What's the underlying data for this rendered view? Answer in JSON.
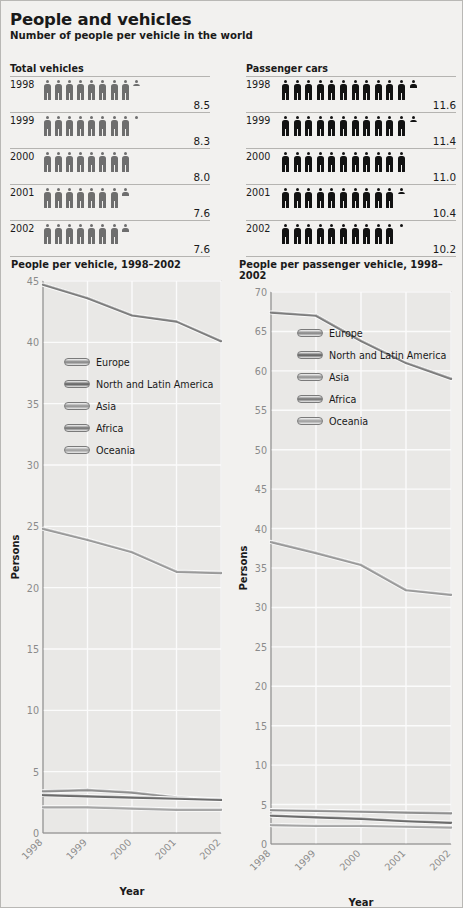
{
  "header": {
    "title": "People and vehicles",
    "subtitle": "Number of people per vehicle in the world"
  },
  "pictograms": [
    {
      "heading": "Total vehicles",
      "icon_color": "#6e6e6e",
      "rows": [
        {
          "year": "1998",
          "value": "8.5",
          "whole": 8,
          "fraction": 0.5
        },
        {
          "year": "1999",
          "value": "8.3",
          "whole": 8,
          "fraction": 0.3
        },
        {
          "year": "2000",
          "value": "8.0",
          "whole": 8,
          "fraction": 0.0
        },
        {
          "year": "2001",
          "value": "7.6",
          "whole": 7,
          "fraction": 0.6
        },
        {
          "year": "2002",
          "value": "7.6",
          "whole": 7,
          "fraction": 0.6
        }
      ]
    },
    {
      "heading": "Passenger cars",
      "icon_color": "#121212",
      "rows": [
        {
          "year": "1998",
          "value": "11.6",
          "whole": 11,
          "fraction": 0.6
        },
        {
          "year": "1999",
          "value": "11.4",
          "whole": 11,
          "fraction": 0.4
        },
        {
          "year": "2000",
          "value": "11.0",
          "whole": 11,
          "fraction": 0.0
        },
        {
          "year": "2001",
          "value": "10.4",
          "whole": 10,
          "fraction": 0.4
        },
        {
          "year": "2002",
          "value": "10.2",
          "whole": 10,
          "fraction": 0.2
        }
      ]
    }
  ],
  "legend_labels": [
    "Europe",
    "North and Latin America",
    "Asia",
    "Africa",
    "Oceania"
  ],
  "series_colors": [
    "#8f8f8f",
    "#6b6b6b",
    "#9a9a9a",
    "#7d7d7d",
    "#a5a5a5"
  ],
  "chart_data": [
    {
      "type": "line",
      "title": "People per vehicle, 1998–2002",
      "xlabel": "Year",
      "ylabel": "Persons",
      "x": [
        "1998",
        "1999",
        "2000",
        "2001",
        "2002"
      ],
      "ylim": [
        0,
        45
      ],
      "yticks": [
        0,
        5,
        10,
        15,
        20,
        25,
        30,
        35,
        40,
        45
      ],
      "grid": true,
      "legend_position": "inside-upper-left",
      "series": [
        {
          "name": "Europe",
          "values": [
            3.4,
            3.5,
            3.3,
            2.9,
            2.7
          ]
        },
        {
          "name": "North and Latin America",
          "values": [
            3.1,
            3.0,
            2.9,
            2.8,
            2.7
          ]
        },
        {
          "name": "Asia",
          "values": [
            24.8,
            23.9,
            22.9,
            21.3,
            21.2
          ]
        },
        {
          "name": "Africa",
          "values": [
            44.7,
            43.6,
            42.2,
            41.7,
            40.1
          ]
        },
        {
          "name": "Oceania",
          "values": [
            2.1,
            2.1,
            2.0,
            1.9,
            1.9
          ]
        }
      ]
    },
    {
      "type": "line",
      "title": "People per passenger vehicle, 1998–2002",
      "xlabel": "Year",
      "ylabel": "Persons",
      "x": [
        "1998",
        "1999",
        "2000",
        "2001",
        "2002"
      ],
      "ylim": [
        0,
        70
      ],
      "yticks": [
        0,
        5,
        10,
        15,
        20,
        25,
        30,
        35,
        40,
        45,
        50,
        55,
        60,
        65,
        70
      ],
      "grid": true,
      "legend_position": "inside-upper-left",
      "series": [
        {
          "name": "Europe",
          "values": [
            4.3,
            4.2,
            4.1,
            4.0,
            3.9
          ]
        },
        {
          "name": "North and Latin America",
          "values": [
            3.6,
            3.4,
            3.2,
            2.9,
            2.7
          ]
        },
        {
          "name": "Asia",
          "values": [
            38.3,
            36.9,
            35.4,
            32.2,
            31.6
          ]
        },
        {
          "name": "Africa",
          "values": [
            67.4,
            67.0,
            63.8,
            61.0,
            59.0
          ]
        },
        {
          "name": "Oceania",
          "values": [
            2.4,
            2.3,
            2.3,
            2.2,
            2.1
          ]
        }
      ]
    }
  ]
}
